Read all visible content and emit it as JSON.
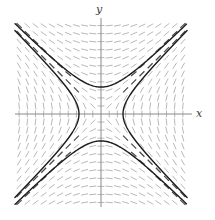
{
  "figure": {
    "kind": "slope-field",
    "width": 215,
    "height": 220,
    "background": "#ffffff"
  },
  "axes": {
    "x_label": "x",
    "y_label": "y",
    "axis_color": "#8a8a8a",
    "axis_stroke_width": 1.0,
    "origin_px": {
      "x": 101,
      "y": 114
    },
    "plot_bounds_px": {
      "left": 15,
      "top": 22,
      "right": 187,
      "bottom": 207
    },
    "x_axis_extent_px": {
      "from": 15,
      "to": 192
    },
    "y_axis_extent_px": {
      "from": 18,
      "to": 207
    }
  },
  "chart_data": {
    "type": "line",
    "title": "",
    "subtitle": "",
    "xlabel": "x",
    "ylabel": "y",
    "xlim": [
      -3.45,
      3.45
    ],
    "ylim": [
      -3.7,
      3.7
    ],
    "grid": false,
    "legend": null,
    "equation": "dy/dx = x/y",
    "slope_field": {
      "color": "#b0b0b0",
      "dark_color": "#4a4a4a",
      "dash_length_px": 7,
      "nx": 21,
      "ny": 23,
      "slope_rule": "x/y",
      "description": "short dashed tick marks whose slope equals x divided by y, forming a saddle pattern that radiates from the origin"
    },
    "solution_curves": {
      "color": "#1c1c1c",
      "stroke_width": 1.4,
      "family": "x^2 - y^2 = c",
      "curves": [
        {
          "name": "right-branch",
          "c": 0.78,
          "opens": "right",
          "vertex": [
            0.88,
            0
          ]
        },
        {
          "name": "left-branch",
          "c": 0.78,
          "opens": "left",
          "vertex": [
            -0.88,
            0
          ]
        },
        {
          "name": "upper-branch",
          "c": -1.16,
          "opens": "up",
          "vertex": [
            0,
            1.08
          ]
        },
        {
          "name": "lower-branch",
          "c": -1.16,
          "opens": "down",
          "vertex": [
            0,
            -1.08
          ]
        }
      ],
      "vertices_px": {
        "right": {
          "x": 126,
          "y": 114
        },
        "left": {
          "x": 76,
          "y": 114
        },
        "upper": {
          "x": 101,
          "y": 56
        },
        "lower": {
          "x": 101,
          "y": 172
        }
      }
    }
  },
  "colors": {
    "curve": "#1c1c1c",
    "axis": "#8a8a8a",
    "field_light": "#b4b4b4",
    "field_dark": "#4a4a4a",
    "label": "#3a3a3a",
    "background": "#ffffff"
  }
}
